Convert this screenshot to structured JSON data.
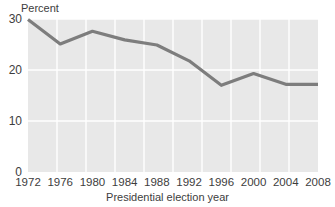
{
  "chart_data": {
    "type": "line",
    "title": "",
    "xlabel": "Presidential election year",
    "ylabel": "Percent",
    "categories": [
      1972,
      1976,
      1980,
      1984,
      1988,
      1992,
      1996,
      2000,
      2004,
      2008
    ],
    "x_tick_labels": [
      "1972",
      "1976",
      "1980",
      "1984",
      "1988",
      "1992",
      "1996",
      "2000",
      "2004",
      "2008"
    ],
    "values": [
      29.9,
      25.1,
      27.6,
      25.9,
      24.9,
      21.8,
      17.0,
      19.3,
      17.2,
      17.2
    ],
    "y_tick_labels": [
      "30",
      "20",
      "10",
      "0"
    ],
    "y_ticks": [
      30,
      20,
      10,
      0
    ],
    "ylim": [
      0,
      30
    ],
    "xlim": [
      1972,
      2008
    ],
    "grid": true,
    "legend": "none",
    "series": [
      {
        "name": "Percent",
        "values": [
          29.9,
          25.1,
          27.6,
          25.9,
          24.9,
          21.8,
          17.0,
          19.3,
          17.2,
          17.2
        ]
      }
    ]
  },
  "style": {
    "line_color": "#7d7d7d",
    "plot_background": "#e8e8e8",
    "gridline_color": "#ffffff",
    "text_color": "#3d3d3d",
    "page_background": "#ffffff",
    "line_width": 3.2
  },
  "geometry": {
    "plot_left": 28,
    "plot_right": 318,
    "plot_top": 19,
    "plot_bottom": 172
  }
}
